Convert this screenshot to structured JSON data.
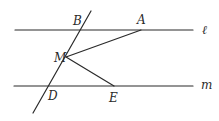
{
  "diagram": {
    "type": "geometry",
    "color": "#2a2a2a",
    "lines": {
      "l": {
        "label": "ℓ",
        "x1": 15,
        "y1": 30,
        "x2": 193,
        "y2": 30,
        "label_x": 202,
        "label_y": 34
      },
      "m": {
        "label": "m",
        "x1": 14,
        "y1": 86,
        "x2": 193,
        "y2": 86,
        "label_x": 201,
        "label_y": 89
      },
      "transversal": {
        "x1": 91,
        "y1": 11,
        "x2": 33,
        "y2": 113
      }
    },
    "segments": [
      {
        "name": "MA",
        "x1": 66,
        "y1": 57,
        "x2": 141,
        "y2": 30
      },
      {
        "name": "ME",
        "x1": 66,
        "y1": 57,
        "x2": 114,
        "y2": 86
      }
    ],
    "points": [
      {
        "name": "B",
        "label": "B",
        "x": 82,
        "y": 30,
        "label_x": 73,
        "label_y": 25
      },
      {
        "name": "A",
        "label": "A",
        "x": 141,
        "y": 30,
        "label_x": 137,
        "label_y": 24
      },
      {
        "name": "M",
        "label": "M",
        "x": 66,
        "y": 57,
        "label_x": 54,
        "label_y": 62
      },
      {
        "name": "D",
        "label": "D",
        "x": 50,
        "y": 86,
        "label_x": 48,
        "label_y": 100
      },
      {
        "name": "E",
        "label": "E",
        "x": 114,
        "y": 86,
        "label_x": 109,
        "label_y": 102
      }
    ]
  }
}
